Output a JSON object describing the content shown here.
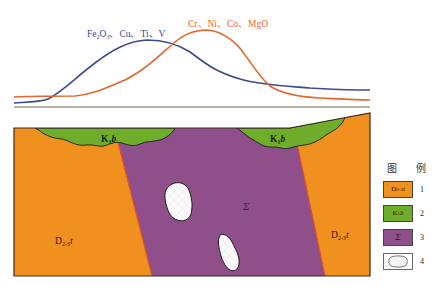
{
  "figure": {
    "colors": {
      "orange_unit": "#F0901E",
      "green_unit": "#6FAE2A",
      "purple_unit": "#8E4F8A",
      "lens_fill": "#FBFBFB",
      "fault_line": "#E0502A",
      "curve_blue": "#3D4A8E",
      "curve_orange": "#E8642A",
      "baseline": "#9A9A86",
      "outline": "#2A2A2A"
    }
  },
  "profile": {
    "curves": [
      {
        "name": "Fe2O3, Cu, Ti, V",
        "label_parts": [
          "Fe",
          "2",
          "O",
          "3",
          "、Cu、Ti、V"
        ],
        "color": "#3D4A8E",
        "peak_x": 147
      },
      {
        "name": "Cr, Ni, Co, MgO",
        "label": "Cr、Ni、Co、MgO",
        "color": "#E8642A",
        "peak_x": 205
      }
    ]
  },
  "section": {
    "labels": {
      "left_host": {
        "main": "D",
        "sub": "2-3",
        "suffix": "t"
      },
      "right_host": {
        "main": "D",
        "sub": "2-3",
        "suffix": "t"
      },
      "left_cover": {
        "main": "K",
        "sub": "1",
        "suffix": "b"
      },
      "right_cover": {
        "main": "K",
        "sub": "1",
        "suffix": "b"
      },
      "intrusion": "Σ"
    }
  },
  "legend": {
    "title": "图 例",
    "items": [
      {
        "num": "1",
        "symbol": "D2-3t",
        "symbol_main": "D",
        "symbol_sub": "2-3",
        "symbol_suffix": "t",
        "color": "#F0901E"
      },
      {
        "num": "2",
        "symbol": "K1b",
        "symbol_main": "K",
        "symbol_sub": "1",
        "symbol_suffix": "b",
        "color": "#6FAE2A"
      },
      {
        "num": "3",
        "symbol": "Σ",
        "color": "#8E4F8A"
      },
      {
        "num": "4",
        "symbol": "lens",
        "color": "#FFFFFF"
      }
    ]
  }
}
